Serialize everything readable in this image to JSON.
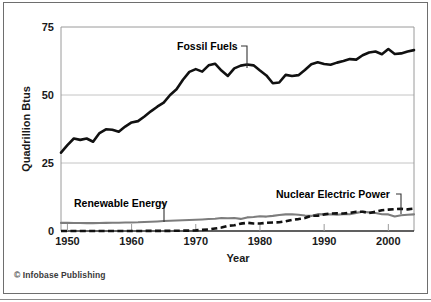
{
  "figure": {
    "credit": "© Infobase Publishing"
  },
  "chart_data": {
    "type": "line",
    "title": "",
    "xlabel": "Year",
    "ylabel": "Quadrillion Btus",
    "xlim": [
      1949,
      2004
    ],
    "ylim": [
      0,
      75
    ],
    "xticks": [
      1950,
      1960,
      1970,
      1980,
      1990,
      2000
    ],
    "xtick_labels": [
      "1950",
      "1960",
      "1970",
      "1980",
      "1990",
      "2000"
    ],
    "yticks": [
      0,
      25,
      50,
      75
    ],
    "ytick_labels": [
      "0",
      "25",
      "50",
      "75"
    ],
    "grid": "horizontal",
    "legend_position": "inline-annotations",
    "annotations": [
      {
        "text": "Fossil Fuels",
        "series": "Fossil Fuels"
      },
      {
        "text": "Renewable Energy",
        "series": "Renewable Energy"
      },
      {
        "text": "Nuclear Electric Power",
        "series": "Nuclear Electric Power"
      }
    ],
    "x": [
      1949,
      1950,
      1951,
      1952,
      1953,
      1954,
      1955,
      1956,
      1957,
      1958,
      1959,
      1960,
      1961,
      1962,
      1963,
      1964,
      1965,
      1966,
      1967,
      1968,
      1969,
      1970,
      1971,
      1972,
      1973,
      1974,
      1975,
      1976,
      1977,
      1978,
      1979,
      1980,
      1981,
      1982,
      1983,
      1984,
      1985,
      1986,
      1987,
      1988,
      1989,
      1990,
      1991,
      1992,
      1993,
      1994,
      1995,
      1996,
      1997,
      1998,
      1999,
      2000,
      2001,
      2002,
      2003,
      2004
    ],
    "series": [
      {
        "name": "Fossil Fuels",
        "color": "#111111",
        "style": "solid",
        "values": [
          28.8,
          31.6,
          34.0,
          33.5,
          34.0,
          32.8,
          36.0,
          37.4,
          37.2,
          36.5,
          38.4,
          39.9,
          40.4,
          42.1,
          44.0,
          45.7,
          47.2,
          50.0,
          52.1,
          55.6,
          58.5,
          59.5,
          58.6,
          60.9,
          61.5,
          59.0,
          57.0,
          59.8,
          60.8,
          61.2,
          60.9,
          59.0,
          57.2,
          54.3,
          54.6,
          57.4,
          57.0,
          57.3,
          59.2,
          61.3,
          62.0,
          61.4,
          61.1,
          61.9,
          62.5,
          63.2,
          63.0,
          64.6,
          65.6,
          66.0,
          65.0,
          66.9,
          65.1,
          65.3,
          66.0,
          66.5
        ]
      },
      {
        "name": "Renewable Energy",
        "color": "#7d7d7d",
        "style": "solid",
        "values": [
          2.97,
          2.98,
          2.95,
          2.92,
          2.9,
          2.9,
          2.95,
          3.0,
          3.02,
          3.05,
          3.1,
          3.15,
          3.2,
          3.3,
          3.4,
          3.5,
          3.65,
          3.75,
          3.85,
          3.95,
          4.05,
          4.15,
          4.25,
          4.4,
          4.5,
          4.75,
          4.7,
          4.75,
          4.45,
          5.0,
          5.15,
          5.45,
          5.3,
          5.55,
          5.9,
          6.1,
          6.15,
          6.0,
          5.7,
          5.55,
          6.2,
          6.1,
          6.15,
          6.0,
          6.2,
          6.15,
          6.65,
          7.05,
          6.85,
          6.6,
          6.15,
          6.1,
          5.35,
          5.8,
          6.0,
          6.1
        ]
      },
      {
        "name": "Nuclear Electric Power",
        "color": "#111111",
        "style": "dashed",
        "values": [
          0.0,
          0.0,
          0.0,
          0.0,
          0.0,
          0.0,
          0.0,
          0.0,
          0.02,
          0.02,
          0.02,
          0.01,
          0.02,
          0.03,
          0.04,
          0.04,
          0.04,
          0.06,
          0.09,
          0.14,
          0.15,
          0.24,
          0.41,
          0.58,
          0.91,
          1.27,
          1.9,
          2.11,
          2.7,
          3.02,
          2.78,
          2.74,
          3.01,
          3.13,
          3.2,
          3.55,
          4.08,
          4.38,
          4.75,
          5.59,
          5.6,
          6.1,
          6.42,
          6.48,
          6.41,
          6.69,
          7.08,
          7.09,
          6.6,
          7.07,
          7.61,
          7.86,
          8.03,
          8.14,
          7.96,
          8.22
        ]
      }
    ]
  }
}
